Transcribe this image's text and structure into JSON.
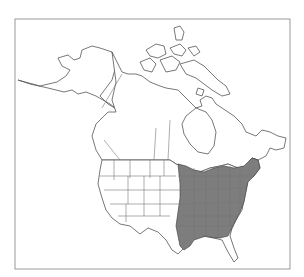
{
  "map": {
    "type": "range-map",
    "region": "North America",
    "frame": {
      "x": 15,
      "y": 19,
      "width": 275,
      "height": 250,
      "stroke": "#9a9a9a"
    },
    "colors": {
      "background": "#ffffff",
      "land_fill": "#ffffff",
      "outline": "#555555",
      "border": "#777777",
      "range_fill": "#7d7d7d",
      "range_border": "#3a3a3a"
    },
    "legend": null,
    "shaded_range": {
      "description": "Eastern United States and southern Ontario/Quebec",
      "states": [
        "Minnesota (east)",
        "Wisconsin",
        "Michigan",
        "Iowa",
        "Missouri",
        "Arkansas",
        "Louisiana (north)",
        "Illinois",
        "Indiana",
        "Ohio",
        "Kentucky",
        "Tennessee",
        "Mississippi",
        "Alabama",
        "Georgia (north)",
        "Pennsylvania",
        "New York",
        "West Virginia",
        "Virginia",
        "Maryland",
        "New Jersey",
        "Connecticut",
        "Massachusetts",
        "Vermont",
        "New Hampshire",
        "Maine (south)",
        "Texas (east)",
        "Oklahoma (east)",
        "Kansas (east)",
        "North Carolina (west)",
        "South Carolina (west)"
      ],
      "canada": [
        "Southern Ontario",
        "Southern Quebec"
      ]
    },
    "paths": {
      "alaska": "M57,82 L66,76 L70,70 L62,66 L58,58 L68,55 L74,60 L80,58 L82,50 L92,46 L100,48 L112,52 L116,66 L112,80 L100,96 L108,104 L118,110 L110,104 L96,96 L86,92 L78,94 L72,90 L64,92 L48,88 L30,84 L18,80 L40,86 Z",
      "canada_mainland": "M112,52 L122,72 L128,74 L136,74 L142,76 L150,82 L160,86 L166,88 L178,90 L184,96 L190,102 L196,108 L202,106 L200,100 L206,96 L212,98 L216,104 L222,108 L228,112 L234,116 L242,124 L246,132 L256,136 L262,130 L270,132 L278,136 L286,138 L284,148 L276,150 L270,148 L266,156 L258,160 L252,158 L246,166 L238,168 L228,164 L220,166 L210,168 L200,172 L192,170 L182,166 L176,164 L170,160 L102,160 L96,150 L92,136 L96,124 L108,112 L116,112 L112,100 L116,82 Z",
      "hudson_bay": "M186,116 L196,108 L206,112 L212,120 L216,132 L214,146 L208,154 L198,152 L190,144 L184,134 L182,124 Z",
      "arctic_islands": [
        "M140,62 L150,58 L156,64 L152,72 L144,70 Z",
        "M146,50 L156,44 L164,46 L166,54 L158,58 L150,56 Z",
        "M160,60 L172,56 L180,62 L176,70 L166,72 Z",
        "M170,48 L180,44 L186,50 L182,56 L174,54 Z",
        "M174,28 L180,26 L184,32 L182,40 L176,40 Z",
        "M180,64 L194,60 L204,66 L212,74 L218,80 L226,86 L230,94 L222,96 L212,90 L204,84 L196,78 L186,74 Z",
        "M188,48 L196,46 L200,52 L194,56 Z",
        "M198,88 L204,90 L202,96 L196,94 Z"
      ],
      "usa": "M102,160 L170,160 L176,164 L182,166 L192,170 L200,172 L210,168 L220,166 L228,164 L238,168 L246,166 L252,158 L258,160 L260,168 L254,176 L248,180 L246,190 L244,200 L242,210 L236,220 L232,228 L230,236 L234,248 L238,258 L234,262 L228,252 L222,240 L214,238 L202,236 L192,238 L186,246 L178,254 L172,250 L166,240 L158,232 L148,228 L140,234 L130,226 L120,224 L112,218 L106,210 L102,198 L98,184 L100,170 Z",
      "range": "M178,164 L186,166 L194,170 L204,172 L214,168 L224,166 L234,168 L244,166 L252,158 L258,160 L260,168 L254,176 L248,182 L246,192 L244,202 L240,212 L236,220 L232,228 L228,236 L220,238 L214,238 L206,236 L200,238 L194,240 L190,246 L184,250 L180,246 L178,236 L176,226 L178,212 L180,198 L180,184 Z"
    },
    "state_lines": [
      "M114,160 L114,180",
      "M130,160 L130,178",
      "M150,160 L150,178",
      "M164,160 L164,176",
      "M100,176 L176,176",
      "M104,190 L178,190",
      "M110,204 L178,204",
      "M118,216 L170,216",
      "M128,176 L128,204",
      "M144,176 L144,216",
      "M160,176 L160,216",
      "M126,204 L126,222",
      "M178,176 L252,176",
      "M178,190 L246,188",
      "M178,204 L242,202",
      "M180,216 L238,216",
      "M178,226 L234,226",
      "M194,168 L194,240",
      "M206,172 L206,236",
      "M218,168 L218,238",
      "M230,166 L230,226",
      "M240,170 L240,212",
      "M120,160 L104,140",
      "M154,160 L156,128",
      "M168,160 L170,120",
      "M122,74 L102,108"
    ]
  }
}
